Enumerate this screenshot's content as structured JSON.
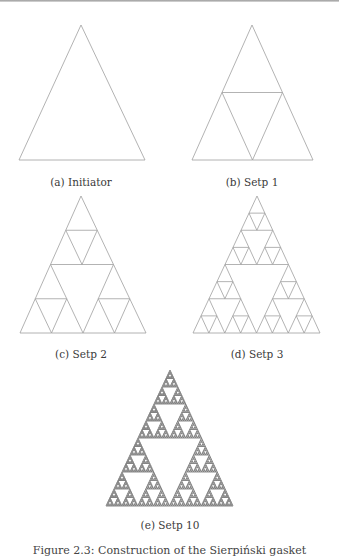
{
  "figure": {
    "caption": "Figure 2.3: Construction of the Sierpiński gasket",
    "line_color": "#a0a0a0",
    "subfigures": [
      {
        "id": "a",
        "label": "(a) Initiator",
        "depth": 0,
        "apex": [
          81,
          25
        ],
        "left": [
          19,
          160
        ],
        "right": [
          145,
          160
        ],
        "caption_pos": [
          81,
          182
        ]
      },
      {
        "id": "b",
        "label": "(b) Setp 1",
        "depth": 1,
        "apex": [
          252,
          25
        ],
        "left": [
          192,
          160
        ],
        "right": [
          313,
          160
        ],
        "caption_pos": [
          252,
          182
        ]
      },
      {
        "id": "c",
        "label": "(c) Setp 2",
        "depth": 2,
        "apex": [
          81,
          196
        ],
        "left": [
          20,
          333
        ],
        "right": [
          146,
          333
        ],
        "caption_pos": [
          81,
          354
        ]
      },
      {
        "id": "d",
        "label": "(d) Setp 3",
        "depth": 3,
        "apex": [
          257,
          196
        ],
        "left": [
          193,
          333
        ],
        "right": [
          320,
          333
        ],
        "caption_pos": [
          257,
          354
        ]
      },
      {
        "id": "e",
        "label": "(e) Setp 10",
        "depth": 6,
        "apex": [
          170,
          370
        ],
        "left": [
          106,
          506
        ],
        "right": [
          233,
          506
        ],
        "caption_pos": [
          170,
          525
        ]
      }
    ]
  }
}
